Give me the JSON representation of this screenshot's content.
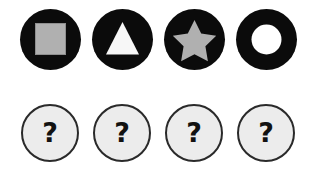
{
  "canvas": {
    "width": 321,
    "height": 179,
    "background": "#ffffff"
  },
  "palette": {
    "disc_black": "#0b0b0b",
    "shape_gray": "#b0b0b0",
    "shape_white": "#f7f7f7",
    "unknown_fill": "#ececec",
    "unknown_border": "#2a2a2a",
    "glyph_black": "#121212"
  },
  "rows": [
    {
      "name": "shape-tokens",
      "items": [
        {
          "id": "token-square",
          "icon": "square-icon",
          "label": "square",
          "fill": "#b0b0b0",
          "disc": "#0b0b0b"
        },
        {
          "id": "token-triangle",
          "icon": "triangle-icon",
          "label": "triangle",
          "fill": "#f7f7f7",
          "disc": "#0b0b0b"
        },
        {
          "id": "token-star",
          "icon": "star-icon",
          "label": "star",
          "fill": "#b0b0b0",
          "disc": "#0b0b0b"
        },
        {
          "id": "token-ring",
          "icon": "ring-icon",
          "label": "ring",
          "fill": "#ffffff",
          "disc": "#0b0b0b"
        }
      ]
    },
    {
      "name": "unknown-slots",
      "items": [
        {
          "id": "unknown-1",
          "icon": "question-mark-icon",
          "symbol": "?"
        },
        {
          "id": "unknown-2",
          "icon": "question-mark-icon",
          "symbol": "?"
        },
        {
          "id": "unknown-3",
          "icon": "question-mark-icon",
          "symbol": "?"
        },
        {
          "id": "unknown-4",
          "icon": "question-mark-icon",
          "symbol": "?"
        }
      ]
    }
  ]
}
